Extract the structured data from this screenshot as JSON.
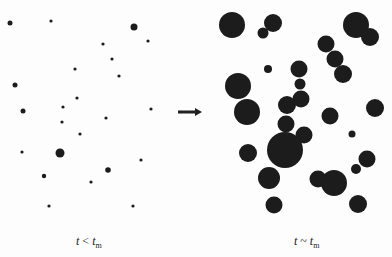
{
  "figure": {
    "left_panel": {
      "label_var": "t",
      "label_rel": " < ",
      "label_sub_var": "t",
      "label_sub": "m",
      "caption": "t < t_m",
      "dots": [
        [
          10,
          23,
          2.5
        ],
        [
          51,
          21,
          1.6
        ],
        [
          134,
          27,
          3.5
        ],
        [
          103,
          44,
          1.6
        ],
        [
          148,
          41,
          1.6
        ],
        [
          112,
          59,
          1.6
        ],
        [
          75,
          69,
          1.6
        ],
        [
          119,
          76,
          1.6
        ],
        [
          15,
          85,
          2.5
        ],
        [
          77,
          98,
          1.6
        ],
        [
          63,
          107,
          1.6
        ],
        [
          23,
          111,
          2.5
        ],
        [
          151,
          109,
          1.6
        ],
        [
          106,
          118,
          1.6
        ],
        [
          62,
          122,
          1.6
        ],
        [
          80,
          134,
          1.6
        ],
        [
          22,
          152,
          1.6
        ],
        [
          60,
          153,
          4.5
        ],
        [
          141,
          160,
          1.6
        ],
        [
          44,
          176,
          2.2
        ],
        [
          108,
          170,
          2.8
        ],
        [
          91,
          182,
          1.6
        ],
        [
          49,
          206,
          1.6
        ],
        [
          133,
          206,
          1.6
        ],
        [
          180,
          112,
          1.2
        ]
      ]
    },
    "arrow": {
      "x1": 178,
      "y1": 112,
      "x2": 202,
      "y2": 112,
      "color": "#222222"
    },
    "right_panel": {
      "label_var": "t",
      "label_rel": " ~ ",
      "label_sub_var": "t",
      "label_sub": "m",
      "caption": "t ~ t_m",
      "circles": [
        [
          232,
          25,
          13
        ],
        [
          273,
          23,
          9
        ],
        [
          263,
          33,
          5.5
        ],
        [
          356,
          25,
          13
        ],
        [
          370,
          37,
          9
        ],
        [
          326,
          44,
          8.5
        ],
        [
          335,
          59,
          8.5
        ],
        [
          343,
          74,
          9
        ],
        [
          268,
          69,
          4
        ],
        [
          299,
          69,
          8.5
        ],
        [
          300,
          84,
          5.5
        ],
        [
          301,
          99,
          8.5
        ],
        [
          238,
          86,
          13
        ],
        [
          247,
          112,
          13
        ],
        [
          287,
          105,
          9
        ],
        [
          286,
          124,
          8.5
        ],
        [
          304,
          135,
          8.5
        ],
        [
          285,
          150,
          18
        ],
        [
          330,
          116,
          8.5
        ],
        [
          375,
          108,
          9
        ],
        [
          352,
          134,
          3.5
        ],
        [
          248,
          153,
          9
        ],
        [
          269,
          178,
          11
        ],
        [
          334,
          183,
          13
        ],
        [
          367,
          159,
          8.5
        ],
        [
          356,
          169,
          5
        ],
        [
          318,
          179,
          8.5
        ],
        [
          274,
          205,
          8.5
        ],
        [
          358,
          204,
          9
        ]
      ]
    },
    "colors": {
      "dot": "#1c1c1c",
      "background": "#fdfdfd"
    }
  }
}
